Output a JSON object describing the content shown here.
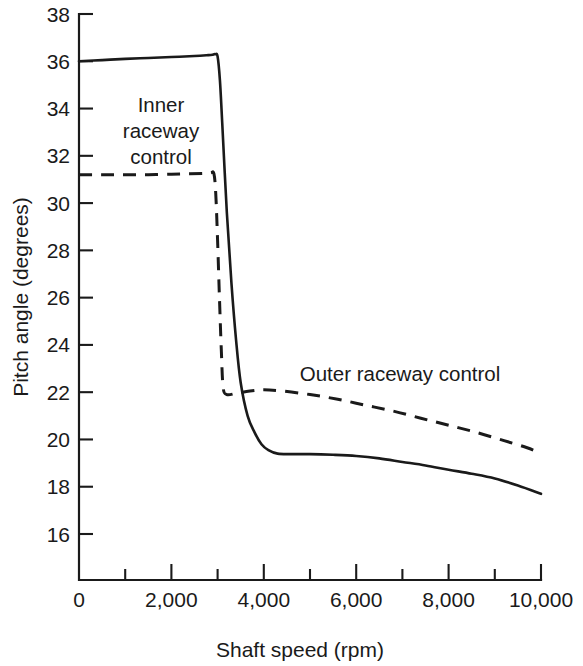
{
  "chart_data": {
    "type": "line",
    "title": "",
    "xlabel": "Shaft speed (rpm)",
    "ylabel": "Pitch angle (degrees)",
    "xlim": [
      0,
      10000
    ],
    "ylim": [
      14.05,
      38
    ],
    "grid": false,
    "legend_position": "inline-annotations",
    "x_ticks_major": [
      0,
      2000,
      4000,
      6000,
      8000,
      10000
    ],
    "x_tick_labels": [
      "0",
      "2,000",
      "4,000",
      "6,000",
      "8,000",
      "10,000"
    ],
    "x_ticks_minor": [
      1000,
      3000,
      5000,
      7000,
      9000
    ],
    "y_ticks_major": [
      16,
      18,
      20,
      22,
      24,
      26,
      28,
      30,
      32,
      34,
      36,
      38
    ],
    "y_tick_labels": [
      "16",
      "18",
      "20",
      "22",
      "24",
      "26",
      "28",
      "30",
      "32",
      "34",
      "36",
      "38"
    ],
    "series": [
      {
        "name": "Inner raceway control",
        "style": "solid",
        "annotation": "Inner\nraceway\ncontrol",
        "annotation_lines": [
          "Inner",
          "raceway",
          "control"
        ],
        "x": [
          0,
          500,
          1000,
          1500,
          2000,
          2500,
          2800,
          2900,
          2950,
          3000,
          3050,
          3100,
          3200,
          3300,
          3400,
          3500,
          3650,
          3800,
          3950,
          4100,
          4300,
          4600,
          5000,
          5500,
          6000,
          6500,
          7000,
          7500,
          8000,
          8500,
          9000,
          9500,
          10000
        ],
        "y": [
          36.0,
          36.05,
          36.1,
          36.14,
          36.18,
          36.22,
          36.26,
          36.28,
          36.3,
          36.2,
          35.2,
          33.4,
          29.6,
          26.6,
          24.2,
          22.4,
          21.0,
          20.3,
          19.8,
          19.55,
          19.4,
          19.38,
          19.38,
          19.35,
          19.3,
          19.2,
          19.05,
          18.9,
          18.72,
          18.55,
          18.35,
          18.05,
          17.7
        ]
      },
      {
        "name": "Outer raceway control",
        "style": "dashed",
        "annotation": "Outer raceway control",
        "x": [
          0,
          500,
          1000,
          1500,
          2000,
          2400,
          2700,
          2850,
          2920,
          2960,
          3000,
          3040,
          3080,
          3120,
          3200,
          3400,
          3700,
          4000,
          4400,
          5000,
          5600,
          6200,
          6800,
          7400,
          8000,
          8600,
          9200,
          9700,
          10000
        ],
        "y": [
          31.2,
          31.2,
          31.2,
          31.2,
          31.22,
          31.24,
          31.26,
          31.28,
          31.25,
          30.4,
          28.4,
          26.0,
          23.8,
          22.2,
          21.9,
          21.95,
          22.05,
          22.1,
          22.05,
          21.9,
          21.7,
          21.45,
          21.2,
          20.9,
          20.6,
          20.3,
          19.95,
          19.65,
          19.4
        ]
      }
    ]
  },
  "annotations": {
    "inner_line1": "Inner",
    "inner_line2": "raceway",
    "inner_line3": "control",
    "outer": "Outer raceway control"
  },
  "axes": {
    "x_title": "Shaft speed (rpm)",
    "y_title": "Pitch angle (degrees)"
  },
  "colors": {
    "ink": "#1a1a1a",
    "background": "#ffffff"
  }
}
